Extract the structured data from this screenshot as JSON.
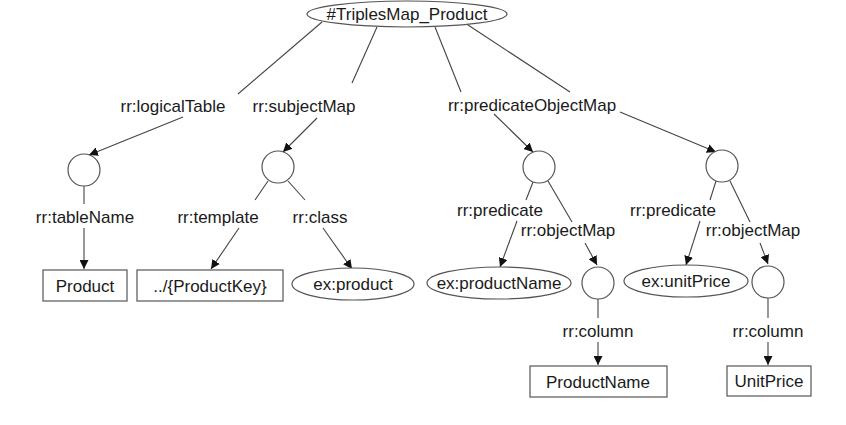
{
  "diagram": {
    "nodes": [
      {
        "id": "root",
        "type": "ellipse",
        "label": "#TriplesMap_Product"
      },
      {
        "id": "lt",
        "type": "blank",
        "label": ""
      },
      {
        "id": "sm",
        "type": "blank",
        "label": ""
      },
      {
        "id": "pom1",
        "type": "blank",
        "label": ""
      },
      {
        "id": "pom2",
        "type": "blank",
        "label": ""
      },
      {
        "id": "product_table",
        "type": "literal-box",
        "label": "Product"
      },
      {
        "id": "template",
        "type": "literal-box",
        "label": "../{ProductKey}"
      },
      {
        "id": "ex_product",
        "type": "ellipse",
        "label": "ex:product"
      },
      {
        "id": "ex_productName",
        "type": "ellipse",
        "label": "ex:productName"
      },
      {
        "id": "om1",
        "type": "blank",
        "label": ""
      },
      {
        "id": "ex_unitPrice",
        "type": "ellipse",
        "label": "ex:unitPrice"
      },
      {
        "id": "om2",
        "type": "blank",
        "label": ""
      },
      {
        "id": "col_productName",
        "type": "literal-box",
        "label": "ProductName"
      },
      {
        "id": "col_unitPrice",
        "type": "literal-box",
        "label": "UnitPrice"
      }
    ],
    "edges": [
      {
        "from": "root",
        "to": "lt",
        "label": "rr:logicalTable"
      },
      {
        "from": "root",
        "to": "sm",
        "label": "rr:subjectMap"
      },
      {
        "from": "root",
        "to": "pom1",
        "label": "rr:predicateObjectMap"
      },
      {
        "from": "root",
        "to": "pom2",
        "label": ""
      },
      {
        "from": "lt",
        "to": "product_table",
        "label": "rr:tableName"
      },
      {
        "from": "sm",
        "to": "template",
        "label": "rr:template"
      },
      {
        "from": "sm",
        "to": "ex_product",
        "label": "rr:class"
      },
      {
        "from": "pom1",
        "to": "ex_productName",
        "label": "rr:predicate"
      },
      {
        "from": "pom1",
        "to": "om1",
        "label": "rr:objectMap"
      },
      {
        "from": "om1",
        "to": "col_productName",
        "label": "rr:column"
      },
      {
        "from": "pom2",
        "to": "ex_unitPrice",
        "label": "rr:predicate"
      },
      {
        "from": "pom2",
        "to": "om2",
        "label": "rr:objectMap"
      },
      {
        "from": "om2",
        "to": "col_unitPrice",
        "label": "rr:column"
      }
    ]
  }
}
